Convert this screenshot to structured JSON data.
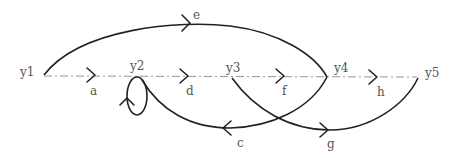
{
  "diagram": {
    "type": "signal-flow-graph",
    "nodes": [
      {
        "id": "y1",
        "label": "y1"
      },
      {
        "id": "y2",
        "label": "y2"
      },
      {
        "id": "y3",
        "label": "y3"
      },
      {
        "id": "y4",
        "label": "y4"
      },
      {
        "id": "y5",
        "label": "y5"
      }
    ],
    "branches": [
      {
        "id": "a",
        "label": "a",
        "from": "y1",
        "to": "y2"
      },
      {
        "id": "d",
        "label": "d",
        "from": "y2",
        "to": "y3"
      },
      {
        "id": "f",
        "label": "f",
        "from": "y3",
        "to": "y4"
      },
      {
        "id": "h",
        "label": "h",
        "from": "y4",
        "to": "y5"
      },
      {
        "id": "e",
        "label": "e",
        "from": "y1",
        "to": "y4"
      },
      {
        "id": "c",
        "label": "c",
        "from": "y4",
        "to": "y2"
      },
      {
        "id": "g",
        "label": "g",
        "from": "y3",
        "to": "y5"
      },
      {
        "id": "b",
        "label": "",
        "from": "y2",
        "to": "y2",
        "kind": "self-loop"
      }
    ],
    "colors": {
      "branch": "#222222",
      "forward_path": "#999999",
      "label": "#555555"
    }
  }
}
